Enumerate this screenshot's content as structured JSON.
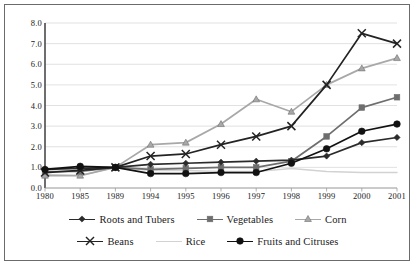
{
  "chart_data": {
    "type": "line",
    "title": "",
    "xlabel": "",
    "ylabel": "",
    "ylim": [
      0.0,
      8.0
    ],
    "ytick_step": 1.0,
    "grid": true,
    "legend_position": "bottom",
    "categories": [
      "1980",
      "1985",
      "1989",
      "1994",
      "1995",
      "1996",
      "1997",
      "1998",
      "1999",
      "2000",
      "2001"
    ],
    "ytick_labels": [
      "8.0",
      "7.0",
      "6.0",
      "5.0",
      "4.0",
      "3.0",
      "2.0",
      "1.0",
      "0.0"
    ],
    "series": [
      {
        "name": "Roots and Tubers",
        "marker": "diamond",
        "color": "#2b2b2b",
        "values": [
          0.9,
          0.95,
          1.0,
          1.15,
          1.2,
          1.25,
          1.3,
          1.35,
          1.55,
          2.2,
          2.45
        ]
      },
      {
        "name": "Vegetables",
        "marker": "square",
        "color": "#6e6e6e",
        "values": [
          0.8,
          0.8,
          1.0,
          0.9,
          0.95,
          1.0,
          1.0,
          1.3,
          2.5,
          3.9,
          4.4
        ]
      },
      {
        "name": "Corn",
        "marker": "triangle",
        "color": "#a8a8a8",
        "values": [
          0.6,
          0.6,
          1.0,
          2.1,
          2.2,
          3.1,
          4.3,
          3.7,
          5.0,
          5.8,
          6.3
        ]
      },
      {
        "name": "Beans",
        "marker": "cross",
        "color": "#232323",
        "values": [
          0.75,
          0.85,
          1.0,
          1.55,
          1.65,
          2.1,
          2.5,
          3.0,
          5.0,
          7.5,
          7.0
        ]
      },
      {
        "name": "Rice",
        "marker": "line",
        "color": "#d2d2d2",
        "values": [
          0.65,
          0.6,
          1.0,
          0.85,
          0.85,
          0.8,
          0.8,
          0.95,
          0.8,
          0.75,
          0.75
        ]
      },
      {
        "name": "Fruits and Citruses",
        "marker": "circle",
        "color": "#111111",
        "values": [
          0.9,
          1.05,
          1.0,
          0.7,
          0.7,
          0.75,
          0.75,
          1.2,
          1.9,
          2.75,
          3.1
        ]
      }
    ]
  }
}
